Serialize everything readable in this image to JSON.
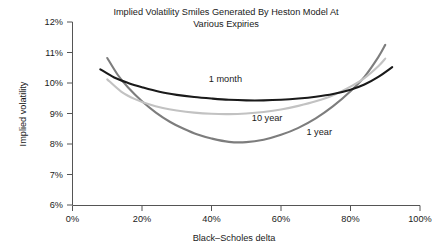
{
  "chart_data": {
    "type": "line",
    "title": "Implied Volatility Smiles Generated By Heston Model At Various Expiries",
    "title_line1": "Implied Volatility Smiles Generated By Heston Model At",
    "title_line2": "Various Expiries",
    "xlabel": "Black–Scholes delta",
    "ylabel": "Implied volatility",
    "xlim": [
      0,
      100
    ],
    "ylim": [
      6,
      12
    ],
    "grid": false,
    "legend_position": "inline-annotations",
    "xticks": [
      "0%",
      "20%",
      "40%",
      "60%",
      "80%",
      "100%"
    ],
    "xtick_values": [
      0,
      20,
      40,
      60,
      80,
      100
    ],
    "yticks": [
      "6%",
      "7%",
      "8%",
      "9%",
      "10%",
      "11%",
      "12%"
    ],
    "ytick_values": [
      6,
      7,
      8,
      9,
      10,
      11,
      12
    ],
    "series": [
      {
        "name": "1 month",
        "color": "#1a1a1a",
        "width": 2.1,
        "label_x": 44,
        "label_y": 10.02,
        "x": [
          8,
          12,
          16,
          20,
          25,
          30,
          35,
          40,
          45,
          50,
          55,
          60,
          65,
          70,
          75,
          80,
          84,
          88,
          92
        ],
        "y": [
          10.45,
          10.18,
          10.0,
          9.86,
          9.71,
          9.61,
          9.54,
          9.49,
          9.45,
          9.43,
          9.43,
          9.45,
          9.49,
          9.55,
          9.64,
          9.78,
          9.95,
          10.2,
          10.52
        ]
      },
      {
        "name": "10 year",
        "color": "#c2c2c2",
        "width": 2.1,
        "label_x": 56,
        "label_y": 8.77,
        "x": [
          10,
          14,
          18,
          22,
          26,
          30,
          35,
          40,
          45,
          50,
          55,
          60,
          65,
          70,
          75,
          80,
          84,
          88,
          90
        ],
        "y": [
          10.12,
          9.72,
          9.47,
          9.3,
          9.18,
          9.1,
          9.03,
          8.99,
          8.98,
          9.0,
          9.05,
          9.13,
          9.25,
          9.4,
          9.6,
          9.88,
          10.16,
          10.55,
          10.8
        ]
      },
      {
        "name": "1 year",
        "color": "#7d7d7d",
        "width": 2.1,
        "label_x": 71,
        "label_y": 8.28,
        "x": [
          10,
          13,
          16,
          20,
          24,
          28,
          32,
          36,
          40,
          45,
          50,
          55,
          60,
          65,
          70,
          75,
          80,
          84,
          88,
          90
        ],
        "y": [
          10.82,
          10.27,
          9.85,
          9.4,
          9.03,
          8.73,
          8.5,
          8.31,
          8.18,
          8.07,
          8.06,
          8.14,
          8.3,
          8.53,
          8.84,
          9.24,
          9.73,
          10.2,
          10.85,
          11.25
        ]
      }
    ]
  },
  "axis": {
    "y_title": "Implied volatility",
    "x_title": "Black–Scholes delta"
  }
}
